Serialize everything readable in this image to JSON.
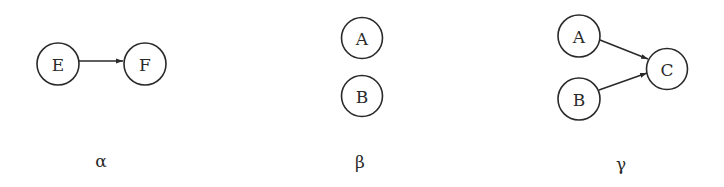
{
  "diagram": {
    "panels": [
      {
        "id": "alpha",
        "label": "α",
        "nodes": [
          {
            "id": "E",
            "label": "E"
          },
          {
            "id": "F",
            "label": "F"
          }
        ],
        "edges": [
          {
            "from": "E",
            "to": "F"
          }
        ]
      },
      {
        "id": "beta",
        "label": "β",
        "nodes": [
          {
            "id": "A",
            "label": "A"
          },
          {
            "id": "B",
            "label": "B"
          }
        ],
        "edges": []
      },
      {
        "id": "gamma",
        "label": "γ",
        "nodes": [
          {
            "id": "A",
            "label": "A"
          },
          {
            "id": "B",
            "label": "B"
          },
          {
            "id": "C",
            "label": "C"
          }
        ],
        "edges": [
          {
            "from": "A",
            "to": "C"
          },
          {
            "from": "B",
            "to": "C"
          }
        ]
      }
    ],
    "colors": {
      "stroke": "#2a2a2a",
      "background": "#ffffff"
    }
  }
}
